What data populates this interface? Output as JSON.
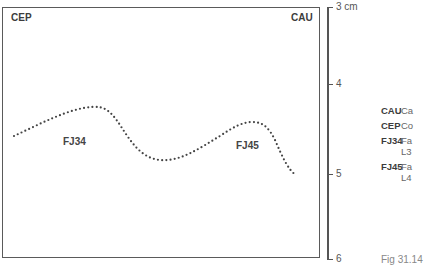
{
  "diagram": {
    "corner_labels": {
      "top_left": "CEP",
      "top_right": "CAU"
    },
    "curve_labels": {
      "left_segment": "FJ34",
      "right_segment": "FJ45"
    },
    "scale": {
      "unit_label": "3 cm",
      "ticks": [
        "3 cm",
        "4",
        "5",
        "6"
      ]
    },
    "legend": [
      {
        "abbr": "CAU",
        "desc": "Ca",
        "cont": ""
      },
      {
        "abbr": "CEP",
        "desc": "Co",
        "cont": ""
      },
      {
        "abbr": "FJ34",
        "desc": "Fa",
        "cont": "L3"
      },
      {
        "abbr": "FJ45",
        "desc": "Fa",
        "cont": "L4"
      }
    ],
    "caption": "Fig 31.14",
    "colors": {
      "line": "#555555",
      "dots": "#444444",
      "text": "#3c3c3c"
    }
  }
}
